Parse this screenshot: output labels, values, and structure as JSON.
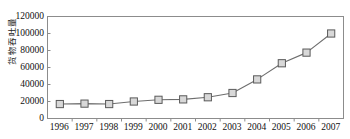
{
  "chart_data": {
    "type": "line",
    "title": "",
    "subtitle": "",
    "xlabel": "",
    "ylabel": "货物吞吐量",
    "categories": [
      "1996",
      "1997",
      "1998",
      "1999",
      "2000",
      "2001",
      "2002",
      "2003",
      "2004",
      "2005",
      "2006",
      "2007"
    ],
    "values": [
      17000,
      17500,
      17000,
      20000,
      22000,
      22500,
      25000,
      30000,
      46000,
      65000,
      77500,
      100000
    ],
    "series": [
      {
        "name": "货物吞吐量",
        "values": [
          17000,
          17500,
          17000,
          20000,
          22000,
          22500,
          25000,
          30000,
          46000,
          65000,
          77500,
          100000
        ]
      }
    ],
    "ylim": [
      0,
      120000
    ],
    "yticks": [
      0,
      20000,
      40000,
      60000,
      80000,
      100000,
      120000
    ],
    "ytick_labels": [
      "0",
      "20000",
      "40000",
      "60000",
      "80000",
      "100000",
      "120000"
    ],
    "xtick_labels": [
      "1996",
      "1997",
      "1998",
      "1999",
      "2000",
      "2001",
      "2002",
      "2003",
      "2004",
      "2005",
      "2006",
      "2007"
    ],
    "grid": false,
    "legend": "none",
    "marker": "square",
    "colors": {
      "line": "#6e6e6e",
      "marker_fill": "#d8d8d8",
      "marker_edge": "#5a5a5a",
      "axis": "#8c8c8c",
      "text": "#111111",
      "background": "#ffffff"
    }
  }
}
